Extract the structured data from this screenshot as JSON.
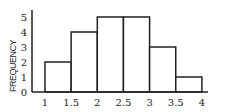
{
  "chart_data": {
    "type": "bar",
    "subtype": "histogram",
    "title": "",
    "xlabel": "",
    "ylabel": "FREQUENCY",
    "bins": [
      [
        1,
        1.5
      ],
      [
        1.5,
        2
      ],
      [
        2,
        2.5
      ],
      [
        2.5,
        3
      ],
      [
        3,
        3.5
      ],
      [
        3.5,
        4
      ]
    ],
    "categories": [
      "1-1.5",
      "1.5-2",
      "2-2.5",
      "2.5-3",
      "3-3.5",
      "3.5-4"
    ],
    "values": [
      2,
      4,
      5,
      5,
      3,
      1
    ],
    "xlim": [
      1,
      4
    ],
    "ylim": [
      0,
      5
    ],
    "x_ticks": [
      "1",
      "1.5",
      "2",
      "2.5",
      "3",
      "3.5",
      "4"
    ],
    "y_ticks": [
      "0",
      "1",
      "2",
      "3",
      "4",
      "5"
    ],
    "grid": false,
    "legend": null
  },
  "colors": {
    "ink": "#222222",
    "fill": "#ffffff"
  }
}
